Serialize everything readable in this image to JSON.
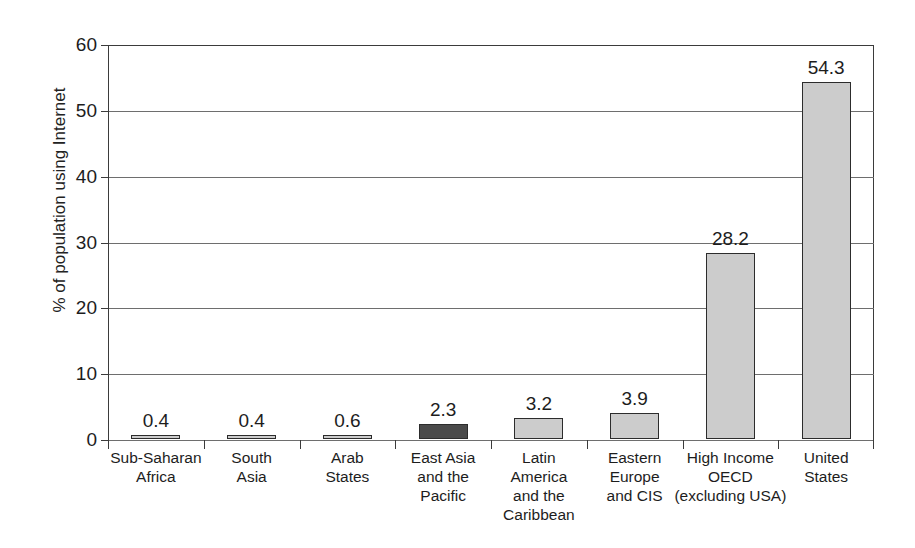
{
  "chart_data": {
    "type": "bar",
    "title": "",
    "xlabel": "",
    "ylabel": "% of population using Internet",
    "ylim": [
      0,
      60
    ],
    "yticks": [
      0,
      10,
      20,
      30,
      40,
      50,
      60
    ],
    "grid": true,
    "legend": "none",
    "categories": [
      "Sub-Saharan Africa",
      "South Asia",
      "Arab States",
      "East Asia and the Pacific",
      "Latin America and the Caribbean",
      "Eastern Europe and CIS",
      "High Income OECD (excluding USA)",
      "United States"
    ],
    "values": [
      0.4,
      0.4,
      0.6,
      2.3,
      3.2,
      3.9,
      28.2,
      54.3
    ],
    "value_labels": [
      "0.4",
      "0.4",
      "0.6",
      "2.3",
      "3.2",
      "3.9",
      "28.2",
      "54.3"
    ],
    "bar_colors": [
      "#cccccc",
      "#cccccc",
      "#cccccc",
      "#4a4a4a",
      "#cccccc",
      "#cccccc",
      "#cccccc",
      "#cccccc"
    ],
    "bar_edge_color": "#2c2c2c",
    "category_label_lines": [
      [
        "Sub-Saharan",
        "Africa"
      ],
      [
        "South",
        "Asia"
      ],
      [
        "Arab",
        "States"
      ],
      [
        "East Asia",
        "and the",
        "Pacific"
      ],
      [
        "Latin",
        "America",
        "and the",
        "Caribbean"
      ],
      [
        "Eastern",
        "Europe",
        "and CIS"
      ],
      [
        "High Income",
        "OECD",
        "(excluding USA)"
      ],
      [
        "United",
        "States"
      ]
    ]
  },
  "axis": {
    "y_title": "% of population using Internet",
    "y_tick_labels": [
      "0",
      "10",
      "20",
      "30",
      "40",
      "50",
      "60"
    ]
  }
}
